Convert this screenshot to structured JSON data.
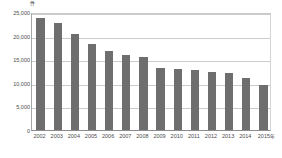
{
  "chart_data": {
    "type": "bar",
    "title": "",
    "xlabel": "",
    "ylabel": "件",
    "categories": [
      "2002",
      "2003",
      "2004",
      "2005",
      "2006",
      "2007",
      "2008",
      "2009",
      "2010",
      "2011",
      "2012",
      "2013",
      "2014",
      "2015"
    ],
    "values": [
      23800,
      22600,
      20400,
      18200,
      16800,
      15800,
      15500,
      13200,
      13000,
      12800,
      12200,
      12100,
      11000,
      9600
    ],
    "ylim": [
      0,
      25000
    ],
    "ytick_labels": [
      "25,000",
      "20,000",
      "15,000",
      "10,000",
      "5,000",
      "0"
    ],
    "ytick_values": [
      25000,
      20000,
      15000,
      10000,
      5000,
      0
    ],
    "y_unit_label": "件",
    "x_unit_suffix": "年",
    "grid": true,
    "legend": "none",
    "bar_color": "#6e6e6e",
    "gridline_color": "#cccccc",
    "axis_color": "#8c8c8c",
    "background_color": "#ffffff"
  }
}
